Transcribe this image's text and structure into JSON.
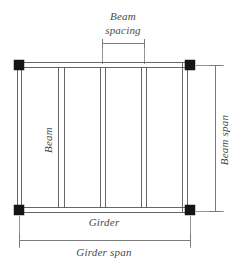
{
  "diagram": {
    "type": "engineering-schematic",
    "labels": {
      "beam_spacing_line1": "Beam",
      "beam_spacing_line2": "spacing",
      "beam": "Beam",
      "girder": "Girder",
      "girder_span": "Girder span",
      "beam_span": "Beam span"
    },
    "colors": {
      "background": "#ffffff",
      "member_stroke": "#575757",
      "member_stroke_dark": "#2f2f2f",
      "dimension_stroke": "#6d6d6d",
      "extension_stroke": "#7a7a7a",
      "node_fill": "#151515",
      "text": "#4a4a4a"
    },
    "frame": {
      "left": 19,
      "right": 190,
      "top": 65,
      "bottom": 210,
      "node_size": 10
    },
    "columns": [
      {
        "name": "column-top-left",
        "x": 19,
        "y": 65
      },
      {
        "name": "column-top-right",
        "x": 190,
        "y": 65
      },
      {
        "name": "column-bottom-left",
        "x": 19,
        "y": 210
      },
      {
        "name": "column-bottom-right",
        "x": 190,
        "y": 210
      }
    ],
    "beams": [
      {
        "name": "beam-1",
        "x_left": 17.0,
        "x_right": 21.8
      },
      {
        "name": "beam-2",
        "x_left": 58.8,
        "x_right": 64.6
      },
      {
        "name": "beam-3",
        "x_left": 100.0,
        "x_right": 105.6
      },
      {
        "name": "beam-4",
        "x_left": 141.2,
        "x_right": 146.6
      },
      {
        "name": "beam-5",
        "x_left": 182.2,
        "x_right": 187.6
      }
    ],
    "girders": [
      {
        "name": "girder-top",
        "y_top": 62.6,
        "y_bottom": 67.4
      },
      {
        "name": "girder-bottom",
        "y_top": 207.6,
        "y_bottom": 212.4
      }
    ],
    "dimensions": [
      {
        "name": "beam-spacing-dimension",
        "orientation": "horizontal",
        "line_y": 43,
        "x_start": 102.5,
        "x_end": 144.0,
        "tick_half": 5,
        "ext_from": 48,
        "ext_to": 64,
        "label": "Beam spacing"
      },
      {
        "name": "beam-span-dimension",
        "orientation": "vertical",
        "line_x": 215,
        "y_start": 65,
        "y_end": 211,
        "tick_half": 6,
        "ext_start_x": 196,
        "ext_end_x": 224,
        "label": "Beam span"
      },
      {
        "name": "girder-span-dimension",
        "orientation": "horizontal",
        "line_y": 240,
        "x_start": 19,
        "x_end": 190,
        "tick_half": 6,
        "ext_from": 216,
        "ext_to": 248,
        "label": "Girder span"
      }
    ]
  }
}
